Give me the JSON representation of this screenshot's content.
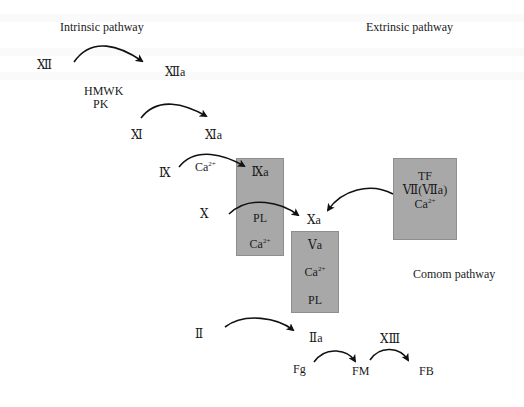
{
  "titles": {
    "intrinsic": "Intrinsic pathway",
    "extrinsic": "Extrinsic pathway",
    "common": "Comom pathway"
  },
  "factors": {
    "xii": "Ⅻ",
    "xiia": "Ⅻa",
    "hmwk": "HMWK",
    "pk": "PK",
    "xi": "Ⅺ",
    "xia": "Ⅺa",
    "ix": "Ⅸ",
    "ca_ix": "Ca",
    "ca_sup": "2+",
    "x": "Ⅹ",
    "xa": "Ⅹa",
    "ii": "Ⅱ",
    "iia": "Ⅱa",
    "fg": "Fg",
    "fm": "FM",
    "xiii": "ⅩⅢ",
    "fb": "FB"
  },
  "boxes": {
    "ixa_complex": {
      "line1": "Ⅸa",
      "line2": "PL",
      "line3": "Ca",
      "line3_sup": "2+"
    },
    "va_complex": {
      "line1": "Ⅴa",
      "line2": "Ca",
      "line2_sup": "2+",
      "line3": "PL"
    },
    "tf_complex": {
      "line1": "TF",
      "line2": "Ⅶ(Ⅶa)",
      "line3": "Ca",
      "line3_sup": "2+"
    }
  },
  "colors": {
    "box_fill": "#a8a8a8",
    "box_border": "#8e8e8e",
    "arrow": "#111111",
    "text": "#1a1a1a"
  }
}
